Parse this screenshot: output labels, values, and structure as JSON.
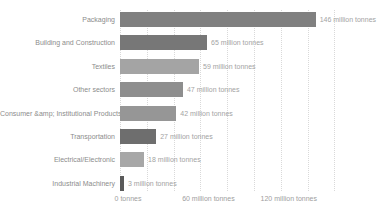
{
  "chart_data": {
    "type": "bar",
    "orientation": "horizontal",
    "title": "",
    "xlabel": "",
    "ylabel": "",
    "xlim": [
      0,
      160
    ],
    "gridline_step": 20,
    "grid": "dotted-vertical",
    "unit_suffix": " million tonnes",
    "categories": [
      "Packaging",
      "Building and Construction",
      "Textiles",
      "Other sectors",
      "Consumer &amp; Institutional Products",
      "Transportation",
      "Electrical/Electronic",
      "Industrial Machinery"
    ],
    "values": [
      146,
      65,
      59,
      47,
      42,
      27,
      18,
      3
    ],
    "value_labels": [
      "146 million tonnes",
      "65 million tonnes",
      "59 million tonnes",
      "47 million tonnes",
      "42 million tonnes",
      "27 million tonnes",
      "18 million tonnes",
      "3 million tonnes"
    ],
    "bar_colors": [
      "#808080",
      "#777777",
      "#a4a4a4",
      "#8e8e8e",
      "#969696",
      "#6e6e6e",
      "#a7a7a7",
      "#5a5a5a"
    ],
    "x_ticks": [
      {
        "value": 0,
        "label": "0 tonnes"
      },
      {
        "value": 60,
        "label": "60 million tonnes"
      },
      {
        "value": 120,
        "label": "120 million tonnes"
      }
    ]
  },
  "colors": {
    "background": "#ffffff",
    "gridline": "#d9d9d9",
    "category_label_text": "#8c8c8c",
    "value_label_text": "#a3a3a3",
    "axis_label_text": "#9e9e9e"
  }
}
